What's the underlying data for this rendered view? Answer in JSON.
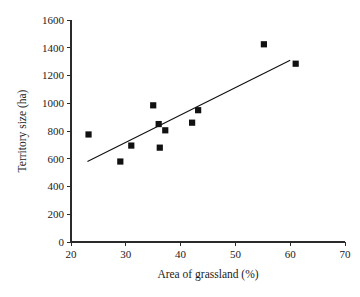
{
  "chart_data": {
    "type": "scatter",
    "title": "",
    "xlabel": "Area of grassland (%)",
    "ylabel": "Territory size (ha)",
    "xlim": [
      20,
      70
    ],
    "ylim": [
      0,
      1600
    ],
    "xticks": [
      20,
      30,
      40,
      50,
      60,
      70
    ],
    "yticks": [
      0,
      200,
      400,
      600,
      800,
      1000,
      1200,
      1400,
      1600
    ],
    "xtick_labels": [
      "20",
      "30",
      "40",
      "50",
      "60",
      "70"
    ],
    "ytick_labels": [
      "0",
      "200",
      "400",
      "600",
      "800",
      "1000",
      "1200",
      "1400",
      "1600"
    ],
    "grid": false,
    "legend": false,
    "marker": "square",
    "marker_color": "#111111",
    "points": [
      {
        "x": 23.2,
        "y": 775
      },
      {
        "x": 29.0,
        "y": 580
      },
      {
        "x": 31.0,
        "y": 695
      },
      {
        "x": 35.0,
        "y": 985
      },
      {
        "x": 36.0,
        "y": 850
      },
      {
        "x": 36.2,
        "y": 680
      },
      {
        "x": 37.2,
        "y": 805
      },
      {
        "x": 42.1,
        "y": 860
      },
      {
        "x": 43.2,
        "y": 950
      },
      {
        "x": 55.2,
        "y": 1425
      },
      {
        "x": 61.0,
        "y": 1285
      }
    ],
    "trendline": {
      "type": "linear",
      "x_start": 23.0,
      "y_start": 580,
      "x_end": 60.0,
      "y_end": 1310,
      "color": "#111111"
    }
  },
  "axes": {
    "x_axis_name": "x-axis",
    "y_axis_name": "y-axis"
  }
}
